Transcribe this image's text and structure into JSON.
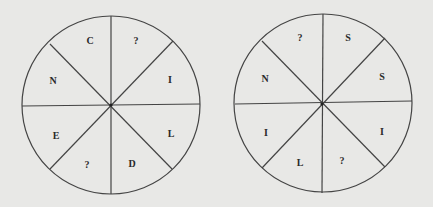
{
  "puzzle": {
    "wheels": [
      {
        "id": "left-wheel",
        "center": [
          111,
          105
        ],
        "radius": 89,
        "segments": [
          {
            "position": "top-left",
            "letter": "C"
          },
          {
            "position": "top-right",
            "letter": "?"
          },
          {
            "position": "right-upper",
            "letter": "I"
          },
          {
            "position": "right-lower",
            "letter": "L"
          },
          {
            "position": "bottom-right",
            "letter": "D"
          },
          {
            "position": "bottom-left",
            "letter": "?"
          },
          {
            "position": "left-lower",
            "letter": "E"
          },
          {
            "position": "left-upper",
            "letter": "N"
          }
        ]
      },
      {
        "id": "right-wheel",
        "center": [
          323,
          103
        ],
        "radius": 89,
        "segments": [
          {
            "position": "top-left",
            "letter": "?"
          },
          {
            "position": "top-right",
            "letter": "S"
          },
          {
            "position": "right-upper",
            "letter": "S"
          },
          {
            "position": "right-lower",
            "letter": "I"
          },
          {
            "position": "bottom-right",
            "letter": "?"
          },
          {
            "position": "bottom-left",
            "letter": "L"
          },
          {
            "position": "left-lower",
            "letter": "I"
          },
          {
            "position": "left-upper",
            "letter": "N"
          }
        ]
      }
    ],
    "colors": {
      "background": "#e8e8e6",
      "line": "#444444",
      "text": "#2a2a2a"
    }
  }
}
